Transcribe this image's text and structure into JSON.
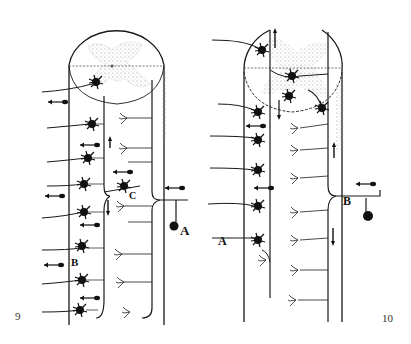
{
  "figures": [
    {
      "number": "9",
      "labels": {
        "A": "A",
        "B": "B",
        "C": "C"
      },
      "description": "Spinal cord segment with gray matter cross-section at top; dorsal root ganglion cell A enters at right, B motor neurons along left column, C interneuron"
    },
    {
      "number": "10",
      "labels": {
        "A": "A",
        "B": "B"
      },
      "description": "Spinal cord segment with gray matter cross-section at top; sensory root B enters at right, A motor neurons along left column"
    }
  ],
  "colors": {
    "background": "#ffffff",
    "ink": "#1a1a1a",
    "stipple": "#9a9a9a"
  }
}
